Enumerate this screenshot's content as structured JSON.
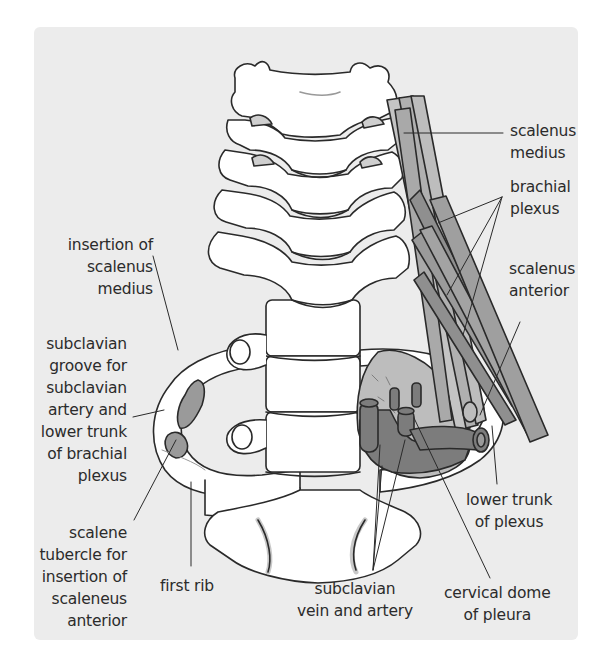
{
  "figure": {
    "colors": {
      "panel_bg": "#ececec",
      "bone_fill": "#ffffff",
      "outline": "#2a2a2a",
      "muscle_light": "#b9b9b9",
      "muscle_dark": "#8f8f8f",
      "vessel": "#7c7c7c",
      "pleura": "#a9a9a9",
      "insertion": "#9a9a9a"
    },
    "labels": {
      "scalenus_medius": [
        "scalenus",
        "medius"
      ],
      "brachial_plexus": [
        "brachial",
        "plexus"
      ],
      "scalenus_anterior": [
        "scalenus",
        "anterior"
      ],
      "insertion_scalenus_medius": [
        "insertion of",
        "scalenus",
        "medius"
      ],
      "subclavian_groove": [
        "subclavian",
        "groove for",
        "subclavian",
        "artery and",
        "lower trunk",
        "of brachial",
        "plexus"
      ],
      "scalene_tubercle": [
        "scalene",
        "tubercle for",
        "insertion of",
        "scaleneus",
        "anterior"
      ],
      "first_rib": [
        "first rib"
      ],
      "subclavian_vessels": [
        "subclavian",
        "vein and artery"
      ],
      "cervical_dome": [
        "cervical dome",
        "of pleura"
      ],
      "lower_trunk": [
        "lower trunk",
        "of plexus"
      ]
    }
  }
}
